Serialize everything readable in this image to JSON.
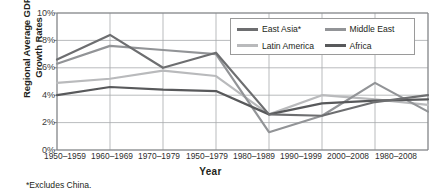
{
  "chart_data": {
    "type": "line",
    "title": "",
    "xlabel": "Year",
    "ylabel_line1": "Regional Average GDP",
    "ylabel_line2": "Growth Rates",
    "footnote": "*Excludes China.",
    "grid": true,
    "legend_position": "top-right",
    "ylim": [
      0,
      10
    ],
    "yticks": [
      "0%",
      "2%",
      "4%",
      "6%",
      "8%",
      "10%"
    ],
    "ytick_values": [
      0,
      2,
      4,
      6,
      8,
      10
    ],
    "categories": [
      "1950–1959",
      "1960–1969",
      "1970–1979",
      "1950–1979",
      "1980–1989",
      "1990–1999",
      "2000–2008",
      "1980–2008"
    ],
    "series": [
      {
        "name": "East Asia*",
        "color": "#6d6e70",
        "values": [
          6.6,
          8.4,
          6.0,
          7.1,
          2.6,
          2.5,
          3.5,
          4.0
        ]
      },
      {
        "name": "Middle East",
        "color": "#929497",
        "values": [
          6.3,
          7.6,
          7.3,
          7.0,
          1.3,
          2.5,
          4.9,
          2.8
        ]
      },
      {
        "name": "Latin America",
        "color": "#b9babc",
        "values": [
          4.9,
          5.2,
          5.8,
          5.4,
          2.6,
          4.0,
          3.7,
          3.3
        ]
      },
      {
        "name": "Africa",
        "color": "#58595b",
        "values": [
          4.0,
          4.6,
          4.4,
          4.3,
          2.6,
          3.4,
          3.6,
          3.7
        ]
      }
    ]
  },
  "legend": {
    "items": [
      {
        "label": "East Asia*",
        "color": "#6d6e70"
      },
      {
        "label": "Middle East",
        "color": "#929497"
      },
      {
        "label": "Latin America",
        "color": "#b9babc"
      },
      {
        "label": "Africa",
        "color": "#58595b"
      }
    ]
  }
}
